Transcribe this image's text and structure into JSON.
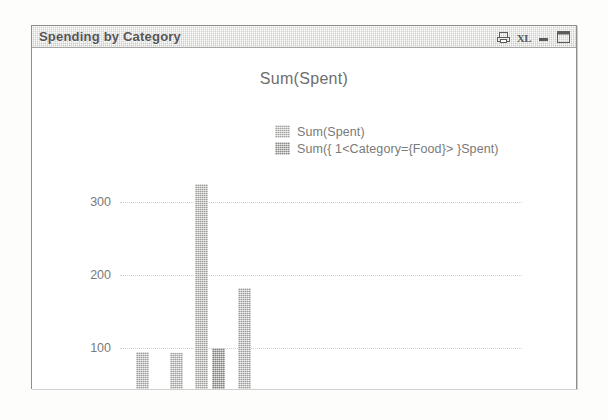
{
  "window": {
    "title": "Spending by Category",
    "controls": [
      {
        "name": "print-icon",
        "label": "print"
      },
      {
        "name": "excel-export-icon",
        "label": "XL"
      },
      {
        "name": "minimize-button",
        "label": "minimize"
      },
      {
        "name": "maximize-button",
        "label": "maximize"
      }
    ]
  },
  "chart_data": {
    "type": "bar",
    "title": "Sum(Spent)",
    "xlabel": "=Month(Date)",
    "ylabel": "",
    "categories": [
      "Jan",
      "Feb",
      "Mar",
      "Apr"
    ],
    "ylim": [
      0,
      340
    ],
    "yticks": [
      0,
      100,
      200,
      300
    ],
    "grid": true,
    "legend_position": "top-center",
    "series": [
      {
        "name": "Sum(Spent)",
        "color": "#c7c7c5",
        "values": [
          95,
          93,
          325,
          183
        ]
      },
      {
        "name": "Sum({ 1<Category={Food}> }Spent)",
        "color": "#b6b6b4",
        "values": [
          null,
          null,
          100,
          null
        ]
      }
    ]
  }
}
